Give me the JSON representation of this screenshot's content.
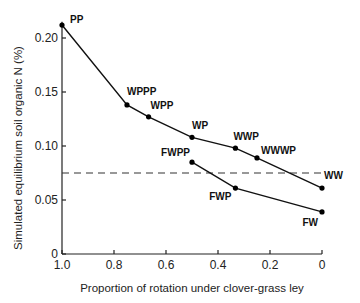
{
  "chart_data": {
    "type": "line",
    "title": "",
    "xlabel": "Proportion of rotation under clover-grass ley",
    "ylabel": "Simulated equilibrium soil organic N (%)",
    "xlim": [
      1.0,
      0
    ],
    "ylim": [
      0,
      0.22
    ],
    "x_ticks": [
      "1.0",
      "0.8",
      "0.6",
      "0.4",
      "0.2",
      "0"
    ],
    "y_ticks": [
      "0",
      "0.05",
      "0.10",
      "0.15",
      "0.20"
    ],
    "grid": false,
    "series": [
      {
        "name": "Upper rotations",
        "points": [
          {
            "label": "PP",
            "x": 1.0,
            "y": 0.212
          },
          {
            "label": "WPPP",
            "x": 0.75,
            "y": 0.138
          },
          {
            "label": "WPP",
            "x": 0.667,
            "y": 0.127
          },
          {
            "label": "WP",
            "x": 0.5,
            "y": 0.108
          },
          {
            "label": "WWP",
            "x": 0.333,
            "y": 0.098
          },
          {
            "label": "WWWP",
            "x": 0.25,
            "y": 0.089
          },
          {
            "label": "WW",
            "x": 0.0,
            "y": 0.061
          }
        ]
      },
      {
        "name": "Fallow rotations",
        "points": [
          {
            "label": "FWPP",
            "x": 0.5,
            "y": 0.085
          },
          {
            "label": "FWP",
            "x": 0.333,
            "y": 0.061
          },
          {
            "label": "FW",
            "x": 0.0,
            "y": 0.039
          }
        ]
      }
    ],
    "reference_line": {
      "style": "dashed",
      "y": 0.075,
      "x_from": 1.0,
      "x_to": 0.0
    }
  }
}
